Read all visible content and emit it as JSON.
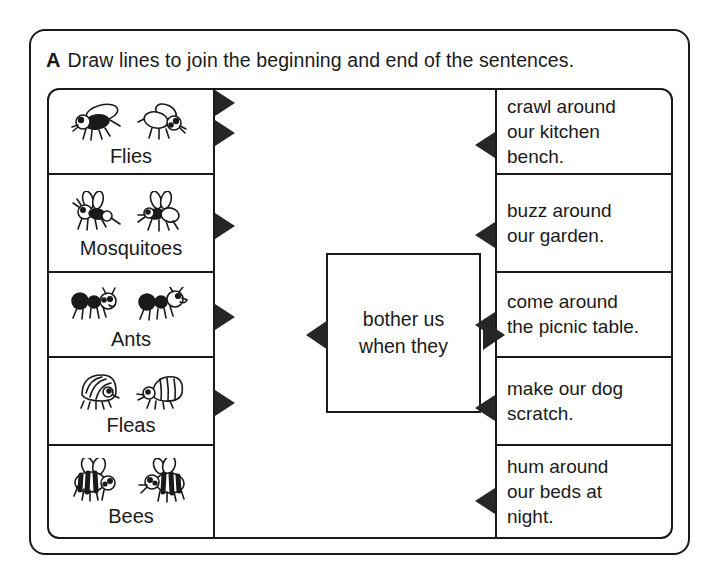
{
  "worksheet": {
    "exercise_letter": "A",
    "instruction": "Draw lines to join the beginning and end of the sentences."
  },
  "center": {
    "line1": "bother us",
    "line2": "when they"
  },
  "left_column": [
    {
      "label": "Flies",
      "icon": "fly-icon"
    },
    {
      "label": "Mosquitoes",
      "icon": "mosquito-icon"
    },
    {
      "label": "Ants",
      "icon": "ant-icon"
    },
    {
      "label": "Fleas",
      "icon": "flea-icon"
    },
    {
      "label": "Bees",
      "icon": "bee-icon"
    }
  ],
  "right_column": [
    {
      "lines": [
        "crawl around",
        "our kitchen",
        "bench."
      ]
    },
    {
      "lines": [
        "buzz around",
        "our garden."
      ]
    },
    {
      "lines": [
        "come around",
        "the picnic table."
      ]
    },
    {
      "lines": [
        "make our dog",
        "scratch."
      ]
    },
    {
      "lines": [
        "hum around",
        "our beds at",
        "night."
      ]
    }
  ],
  "colors": {
    "ink": "#1a1a1a",
    "arrow": "#262626",
    "paper": "#ffffff"
  }
}
